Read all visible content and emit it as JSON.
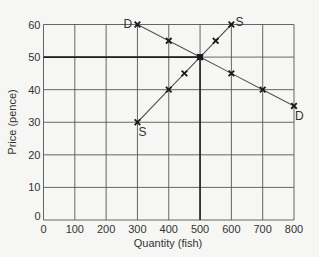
{
  "chart_data": {
    "type": "line",
    "title": "",
    "xlabel": "Quantity (fish)",
    "ylabel": "Price (pence)",
    "xlim": [
      0,
      800
    ],
    "ylim": [
      0,
      60
    ],
    "xticks": [
      0,
      100,
      200,
      300,
      400,
      500,
      600,
      700,
      800
    ],
    "yticks": [
      0,
      10,
      20,
      30,
      40,
      50,
      60
    ],
    "grid": true,
    "legend": "none",
    "series": [
      {
        "name": "Demand (D)",
        "start_label": "D",
        "end_label": "D",
        "points": [
          [
            300,
            60
          ],
          [
            400,
            55
          ],
          [
            500,
            50
          ],
          [
            600,
            45
          ],
          [
            700,
            40
          ],
          [
            800,
            35
          ]
        ]
      },
      {
        "name": "Supply (S)",
        "start_label": "S",
        "end_label": "S",
        "points": [
          [
            300,
            30
          ],
          [
            400,
            40
          ],
          [
            450,
            45
          ],
          [
            500,
            50
          ],
          [
            550,
            55
          ],
          [
            600,
            60
          ]
        ]
      }
    ],
    "equilibrium": {
      "quantity": 500,
      "price": 50
    }
  },
  "colors": {
    "background": "#f6f6f4",
    "grid": "#555555",
    "grid_emphasis": "#222222",
    "line": "#555555",
    "marker": "#1a1a1a",
    "text": "#333333"
  }
}
